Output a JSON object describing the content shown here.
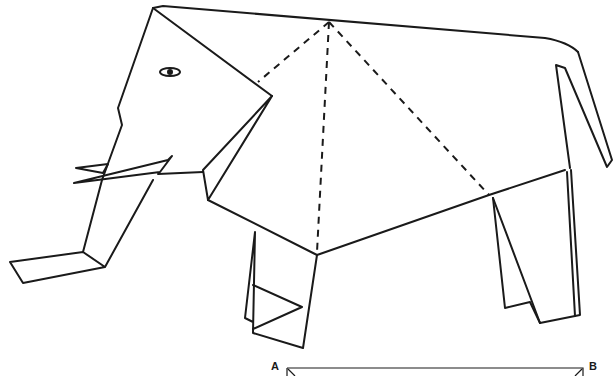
{
  "diagram": {
    "line_color": "#1a1a1a",
    "background": "#ffffff",
    "labels": [
      {
        "id": "A",
        "text": "A",
        "x": 271,
        "y": 362
      },
      {
        "id": "B",
        "text": "B",
        "x": 588,
        "y": 362
      }
    ],
    "parts": [
      "head",
      "eye",
      "trunk",
      "tusks",
      "ear-fold",
      "back",
      "tail",
      "front-leg",
      "rear-leg",
      "dashed-fold-lines",
      "paper-strip-AB"
    ]
  }
}
